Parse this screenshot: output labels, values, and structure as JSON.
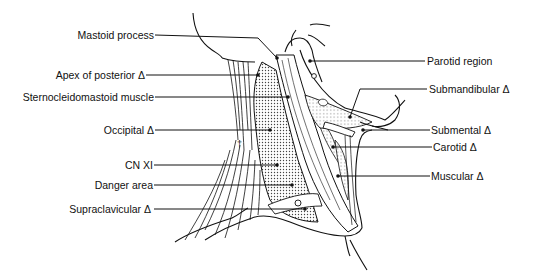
{
  "figure": {
    "left_labels": [
      {
        "id": "mastoid",
        "text": "Mastoid process",
        "y": 35
      },
      {
        "id": "apex",
        "text": "Apex of posterior Δ",
        "y": 75
      },
      {
        "id": "scm",
        "text": "Sternocleidomastoid muscle",
        "y": 97
      },
      {
        "id": "occipital",
        "text": "Occipital Δ",
        "y": 130
      },
      {
        "id": "cnxi",
        "text": "CN XI",
        "y": 165
      },
      {
        "id": "danger",
        "text": "Danger area",
        "y": 185
      },
      {
        "id": "supraclav",
        "text": "Supraclavicular Δ",
        "y": 209
      }
    ],
    "right_labels": [
      {
        "id": "parotid",
        "text": "Parotid region",
        "y": 61
      },
      {
        "id": "submandibular",
        "text": "Submandibular Δ",
        "y": 89
      },
      {
        "id": "submental",
        "text": "Submental Δ",
        "y": 130
      },
      {
        "id": "carotid",
        "text": "Carotid Δ",
        "y": 147
      },
      {
        "id": "muscular",
        "text": "Muscular Δ",
        "y": 176
      }
    ],
    "colors": {
      "line": "#111111",
      "stipple": "#555555",
      "background": "#ffffff"
    }
  }
}
